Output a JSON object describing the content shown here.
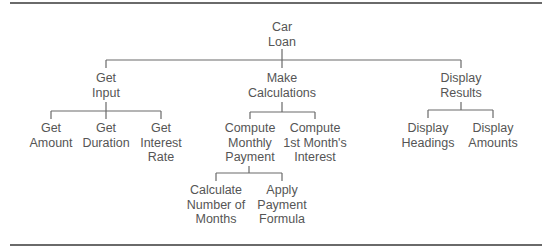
{
  "diagram": {
    "type": "hierarchy-chart",
    "colors": {
      "line": "#6a6a6a",
      "text": "#555555",
      "background": "#ffffff"
    },
    "nodes": {
      "car_loan": {
        "lines": [
          "Car",
          "Loan"
        ]
      },
      "get_input": {
        "lines": [
          "Get",
          "Input"
        ]
      },
      "make_calculations": {
        "lines": [
          "Make",
          "Calculations"
        ]
      },
      "display_results": {
        "lines": [
          "Display",
          "Results"
        ]
      },
      "get_amount": {
        "lines": [
          "Get",
          "Amount"
        ]
      },
      "get_duration": {
        "lines": [
          "Get",
          "Duration"
        ]
      },
      "get_interest_rate": {
        "lines": [
          "Get",
          "Interest",
          "Rate"
        ]
      },
      "compute_monthly_payment": {
        "lines": [
          "Compute",
          "Monthly",
          "Payment"
        ]
      },
      "compute_first_month_interest": {
        "lines": [
          "Compute",
          "1st Month's",
          "Interest"
        ]
      },
      "display_headings": {
        "lines": [
          "Display",
          "Headings"
        ]
      },
      "display_amounts": {
        "lines": [
          "Display",
          "Amounts"
        ]
      },
      "calculate_number_of_months": {
        "lines": [
          "Calculate",
          "Number of",
          "Months"
        ]
      },
      "apply_payment_formula": {
        "lines": [
          "Apply",
          "Payment",
          "Formula"
        ]
      }
    },
    "edges": [
      [
        "car_loan",
        "get_input"
      ],
      [
        "car_loan",
        "make_calculations"
      ],
      [
        "car_loan",
        "display_results"
      ],
      [
        "get_input",
        "get_amount"
      ],
      [
        "get_input",
        "get_duration"
      ],
      [
        "get_input",
        "get_interest_rate"
      ],
      [
        "make_calculations",
        "compute_monthly_payment"
      ],
      [
        "make_calculations",
        "compute_first_month_interest"
      ],
      [
        "display_results",
        "display_headings"
      ],
      [
        "display_results",
        "display_amounts"
      ],
      [
        "compute_monthly_payment",
        "calculate_number_of_months"
      ],
      [
        "compute_monthly_payment",
        "apply_payment_formula"
      ]
    ]
  }
}
